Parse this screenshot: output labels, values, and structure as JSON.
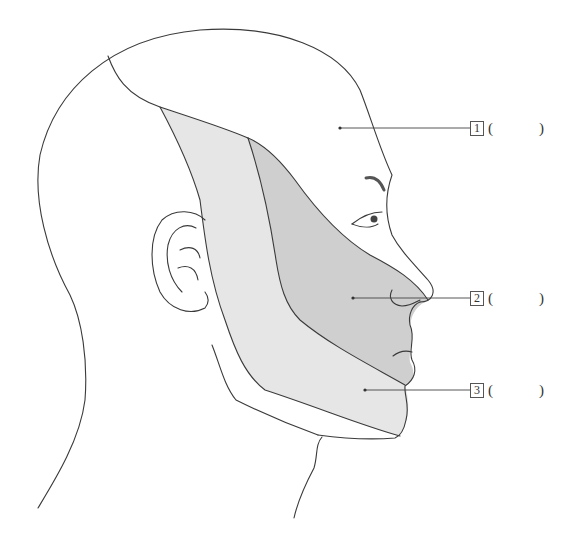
{
  "figure": {
    "colors": {
      "outline": "#3a3a3a",
      "zone_light": "#e6e6e6",
      "zone_dark": "#cfcfcf",
      "background": "#ffffff",
      "leader_line": "#444444"
    }
  },
  "labels": [
    {
      "number": "1",
      "open": "(",
      "blank": "",
      "close": ")"
    },
    {
      "number": "2",
      "open": "(",
      "blank": "",
      "close": ")"
    },
    {
      "number": "3",
      "open": "(",
      "blank": "",
      "close": ")"
    }
  ]
}
